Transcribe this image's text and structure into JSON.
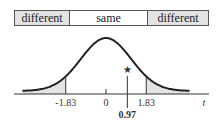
{
  "regions": {
    "left": "different",
    "middle": "same",
    "right": "different"
  },
  "colors": {
    "shade": "#e3e3e3",
    "curve": "#222222"
  },
  "axis": {
    "variable": "t",
    "ticks": [
      "-1.83",
      "0",
      "1.83"
    ],
    "critical_value": 1.83
  },
  "observed": {
    "label": "0.97",
    "value": 0.97,
    "marker": "★"
  }
}
